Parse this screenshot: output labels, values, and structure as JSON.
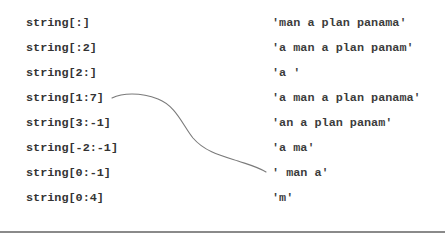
{
  "rows": [
    {
      "expression": "string[:]",
      "result": "'man a plan panama'"
    },
    {
      "expression": "string[:2]",
      "result": "'a man a plan panam'"
    },
    {
      "expression": "string[2:]",
      "result": "'a '"
    },
    {
      "expression": "string[1:7]",
      "result": "'a man a plan panama'"
    },
    {
      "expression": "string[3:-1]",
      "result": "'an a plan panam'"
    },
    {
      "expression": "string[-2:-1]",
      "result": "'a ma'"
    },
    {
      "expression": "string[0:-1]",
      "result": "' man a'"
    },
    {
      "expression": "string[0:4]",
      "result": "'m'"
    }
  ],
  "connector": {
    "from_expression": "string[1:7]",
    "to_result": "' man a'",
    "color": "#7a7a7a"
  },
  "rule_color": "#8a8a8a"
}
